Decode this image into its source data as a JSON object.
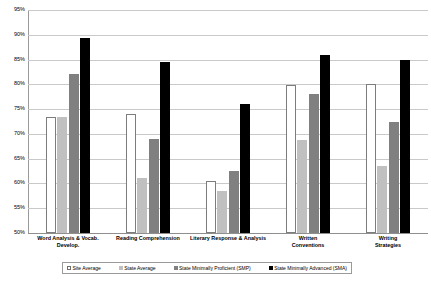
{
  "chart_data": {
    "type": "bar",
    "title": "",
    "xlabel": "",
    "ylabel": "",
    "ylim": [
      50,
      95
    ],
    "ytick_labels": [
      "95%",
      "90%",
      "85%",
      "80%",
      "75%",
      "70%",
      "65%",
      "60%",
      "55%",
      "50%"
    ],
    "ytick_values": [
      95,
      90,
      85,
      80,
      75,
      70,
      65,
      60,
      55,
      50
    ],
    "grid": true,
    "legend_position": "bottom",
    "categories": [
      "Word Analysis & Vocab. Develop.",
      "Reading Comprehension",
      "Literary Response & Analysis",
      "Written Conventions",
      "Writing Strategies"
    ],
    "series": [
      {
        "name": "Site Average",
        "color": "#ffffff",
        "values": [
          73.5,
          74.0,
          60.5,
          79.8,
          80.0
        ]
      },
      {
        "name": "State Average",
        "color": "#c0c0c0",
        "values": [
          73.5,
          61.2,
          58.5,
          68.7,
          63.5
        ]
      },
      {
        "name": "State Minimally Proficient (SMP)",
        "color": "#808080",
        "values": [
          82.0,
          69.0,
          62.5,
          78.0,
          72.5
        ]
      },
      {
        "name": "State Minimally Advanced (SMA)",
        "color": "#000000",
        "values": [
          89.3,
          84.5,
          76.0,
          86.0,
          85.0
        ]
      }
    ]
  },
  "category_label_lines": [
    [
      "Word Analysis & Vocab.",
      "Develop."
    ],
    [
      "Reading Comprehension"
    ],
    [
      "Literary Response & Analysis"
    ],
    [
      "Written",
      "Conventions"
    ],
    [
      "Writing",
      "Strategies"
    ]
  ]
}
